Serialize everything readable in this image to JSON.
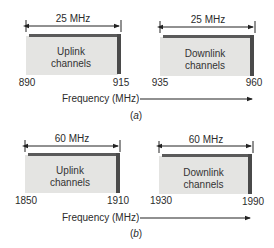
{
  "diagrams": [
    {
      "caption": "(a)",
      "caption_letter": "a",
      "axis_label": "Frequency (MHz)",
      "bands": [
        {
          "name": "Uplink",
          "label_line1": "Uplink",
          "label_line2": "channels",
          "bandwidth": "25 MHz",
          "start": "890",
          "end": "915"
        },
        {
          "name": "Downlink",
          "label_line1": "Downlink",
          "label_line2": "channels",
          "bandwidth": "25 MHz",
          "start": "935",
          "end": "960"
        }
      ]
    },
    {
      "caption": "(b)",
      "caption_letter": "b",
      "axis_label": "Frequency (MHz)",
      "bands": [
        {
          "name": "Uplink",
          "label_line1": "Uplink",
          "label_line2": "channels",
          "bandwidth": "60 MHz",
          "start": "1850",
          "end": "1910"
        },
        {
          "name": "Downlink",
          "label_line1": "Downlink",
          "label_line2": "channels",
          "bandwidth": "60 MHz",
          "start": "1930",
          "end": "1990"
        }
      ]
    }
  ],
  "colors": {
    "box_face": "#e4e4e2",
    "box_edge": "#4a4a4a",
    "line": "#222222"
  }
}
